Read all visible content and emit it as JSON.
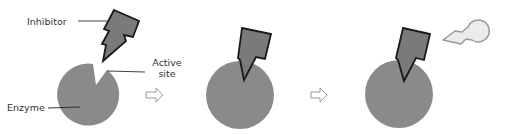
{
  "labels": {
    "inhibitor": "Inhibitor",
    "active_site_line1": "Active",
    "active_site_line2": "site",
    "enzyme": "Enzyme"
  },
  "colors": {
    "enzyme_fill": "#8a8a8a",
    "inhibitor_fill": "#7a7a7a",
    "inhibitor_stroke": "#1a1a1a",
    "product_fill": "#ececec",
    "product_stroke": "#9a9a9a",
    "leader_line": "#444444",
    "arrow_stroke": "#9a9a9a"
  },
  "stages": [
    {
      "name": "inhibitor-approaching"
    },
    {
      "name": "inhibitor-bound"
    },
    {
      "name": "inhibitor-bound-substrate-blocked"
    }
  ]
}
